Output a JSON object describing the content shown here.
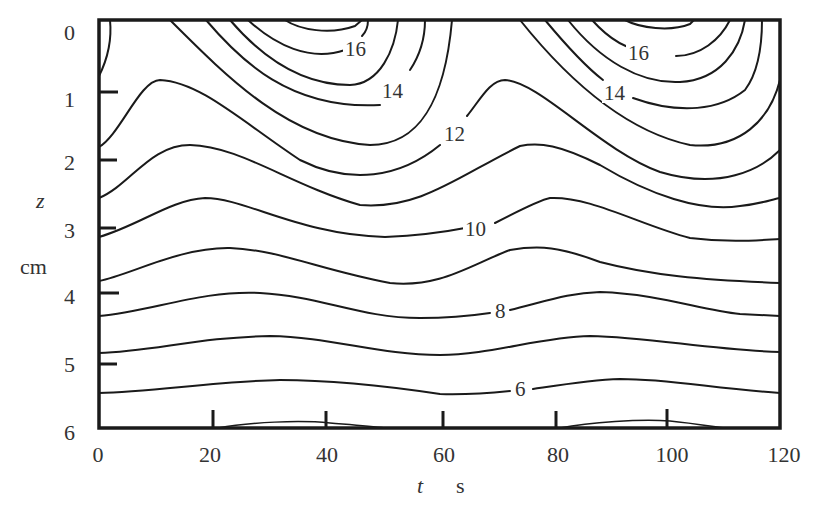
{
  "chart_data": {
    "type": "contour",
    "title": "",
    "xlabel": "t",
    "xunit": "s",
    "ylabel": "z",
    "yunit": "cm",
    "xlim": [
      0,
      120
    ],
    "ylim": [
      6,
      0
    ],
    "y_inverted": true,
    "grid": false,
    "legend": null,
    "x_ticks": [
      "0",
      "20",
      "40",
      "60",
      "80",
      "100",
      "120"
    ],
    "y_ticks": [
      "0",
      "1",
      "2",
      "3",
      "4",
      "5",
      "6"
    ],
    "contour_levels_labeled": [
      "16",
      "14",
      "12",
      "10",
      "8",
      "6"
    ],
    "contour_levels": [
      5,
      6,
      7,
      8,
      9,
      10,
      11,
      12,
      13,
      14,
      15,
      16,
      17
    ],
    "period_s": 60,
    "contour_left_edge_z_cm": [
      0.75,
      1.85,
      2.6,
      3.2,
      3.85,
      4.4,
      4.9,
      5.45
    ],
    "labels": [
      {
        "text": "16",
        "t": 44,
        "z": 0.2
      },
      {
        "text": "14",
        "t": 50,
        "z": 1.05
      },
      {
        "text": "12",
        "t": 63,
        "z": 1.7
      },
      {
        "text": "10",
        "t": 67,
        "z": 3.15
      },
      {
        "text": "8",
        "t": 71,
        "z": 4.3
      },
      {
        "text": "6",
        "t": 75,
        "z": 5.55
      },
      {
        "text": "16",
        "t": 101,
        "z": 0.5
      },
      {
        "text": "14",
        "t": 96,
        "z": 1.05
      }
    ]
  },
  "axes": {
    "x_title_var": "t",
    "x_title_unit": "s",
    "y_title_var": "z",
    "y_title_unit": "cm"
  }
}
